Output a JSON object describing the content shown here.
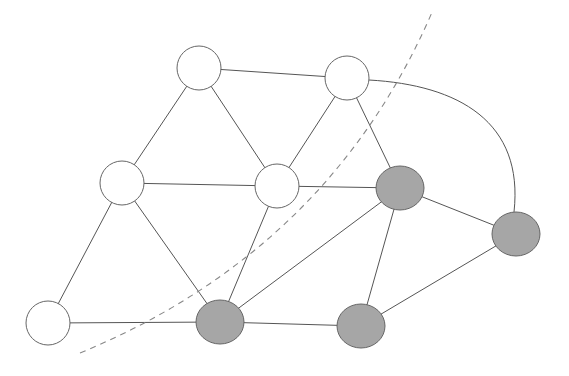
{
  "diagram": {
    "type": "graph-partition",
    "colors": {
      "edge": "#555555",
      "node_stroke": "#666666",
      "unselected_fill": "#ffffff",
      "selected_fill": "#a6a6a6",
      "cut_line": "#888888"
    },
    "nodes": [
      {
        "id": "A",
        "x": 199,
        "y": 68,
        "rx": 22,
        "ry": 22,
        "selected": false
      },
      {
        "id": "B",
        "x": 347,
        "y": 78,
        "rx": 22,
        "ry": 22,
        "selected": false
      },
      {
        "id": "C",
        "x": 122,
        "y": 183,
        "rx": 22,
        "ry": 22,
        "selected": false
      },
      {
        "id": "D",
        "x": 277,
        "y": 186,
        "rx": 22,
        "ry": 22,
        "selected": false
      },
      {
        "id": "E",
        "x": 400,
        "y": 188,
        "rx": 24,
        "ry": 22,
        "selected": true
      },
      {
        "id": "F",
        "x": 516,
        "y": 234,
        "rx": 24,
        "ry": 22,
        "selected": true
      },
      {
        "id": "G",
        "x": 48,
        "y": 323,
        "rx": 22,
        "ry": 22,
        "selected": false
      },
      {
        "id": "H",
        "x": 220,
        "y": 322,
        "rx": 24,
        "ry": 22,
        "selected": true
      },
      {
        "id": "I",
        "x": 361,
        "y": 326,
        "rx": 24,
        "ry": 22,
        "selected": true
      }
    ],
    "edges": [
      {
        "from": "A",
        "to": "B"
      },
      {
        "from": "A",
        "to": "C"
      },
      {
        "from": "A",
        "to": "D"
      },
      {
        "from": "B",
        "to": "D"
      },
      {
        "from": "B",
        "to": "E"
      },
      {
        "from": "B",
        "to": "F",
        "curved": true
      },
      {
        "from": "C",
        "to": "D"
      },
      {
        "from": "C",
        "to": "G"
      },
      {
        "from": "C",
        "to": "H"
      },
      {
        "from": "D",
        "to": "E"
      },
      {
        "from": "D",
        "to": "H"
      },
      {
        "from": "E",
        "to": "H"
      },
      {
        "from": "E",
        "to": "I"
      },
      {
        "from": "E",
        "to": "F"
      },
      {
        "from": "F",
        "to": "I"
      },
      {
        "from": "G",
        "to": "H"
      },
      {
        "from": "H",
        "to": "I"
      }
    ],
    "cut_curve": {
      "style": "dashed",
      "path": "M 80 353 Q 330 250 433 10"
    }
  }
}
